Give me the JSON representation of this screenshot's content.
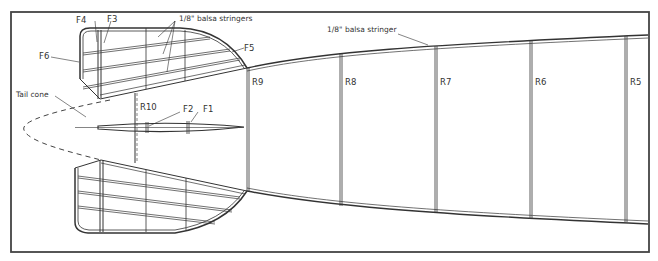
{
  "diagram": {
    "labels": {
      "stringers_group": "1/8\" balsa stringers",
      "stringer_single": "1/8\" balsa stringer",
      "tail_cone": "Tail cone",
      "formers": [
        "F1",
        "F2",
        "F3",
        "F4",
        "F5",
        "F6"
      ],
      "ribs": [
        "R5",
        "R6",
        "R7",
        "R8",
        "R9",
        "R10"
      ]
    },
    "colors": {
      "line": "#333333",
      "frame": "#444444",
      "background": "#ffffff"
    }
  }
}
